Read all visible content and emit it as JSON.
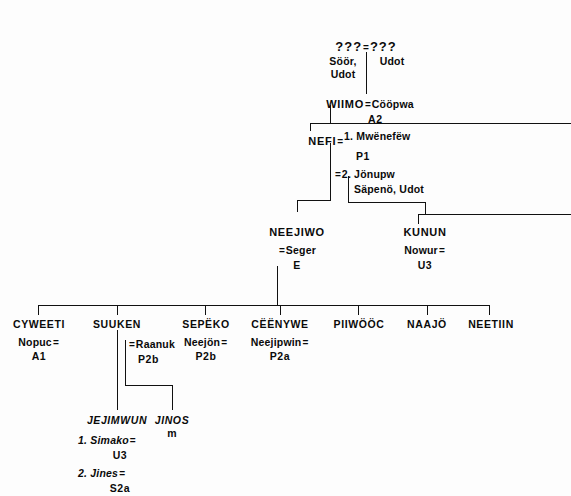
{
  "diagram": {
    "line_color": "#111111",
    "background": "#fdfdfd",
    "equals_symbol": "="
  },
  "generations": {
    "g0": {
      "husband": "???",
      "wife": "???",
      "husband_origin": "Söör,",
      "husband_origin2": "Udot",
      "wife_origin": "Udot"
    },
    "g1": {
      "name": "WIIMO",
      "spouse": "Cööpwa",
      "code": "A2"
    },
    "g2": {
      "name": "NEFI",
      "marriage1_label": "1. Mwënefëw",
      "marriage1_code": "P1",
      "marriage2_label": "2. Jönupw",
      "marriage2_origin": "Säpenö, Udot"
    },
    "g3": [
      {
        "name": "NEEJIWO",
        "spouse": "Seger",
        "code": "E"
      },
      {
        "name": "KUNUN",
        "spouse": "Nowur",
        "code": "U3"
      }
    ],
    "g4": [
      {
        "name": "CYWEETI",
        "spouse": "Nopuc",
        "code": "A1"
      },
      {
        "name": "SUUKEN",
        "spouse": "Raanuk",
        "code": "P2b"
      },
      {
        "name": "SEPËKO",
        "spouse": "Neejön",
        "code": "P2b"
      },
      {
        "name": "CËËNYWE",
        "spouse": "Neejipwin",
        "code": "P2a"
      },
      {
        "name": "PIIWÖÖC",
        "spouse": "",
        "code": ""
      },
      {
        "name": "NAAJÖ",
        "spouse": "",
        "code": ""
      },
      {
        "name": "NEETIIN",
        "spouse": "",
        "code": ""
      }
    ],
    "g5": [
      {
        "name": "JEJIMWUN",
        "marriage1_label": "1. Simako",
        "marriage1_code": "U3",
        "marriage2_label": "2. Jines",
        "marriage2_code": "S2a"
      },
      {
        "name": "JINOS",
        "code": "m"
      }
    ]
  }
}
